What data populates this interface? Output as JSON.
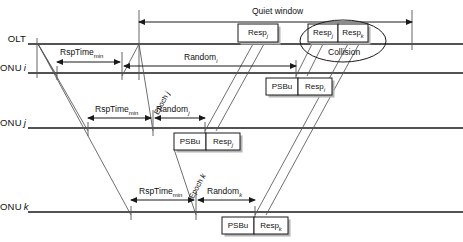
{
  "figure": {
    "line_color": "#1a1a1a",
    "thin_color": "#555555",
    "box_fill": "#ffffff",
    "shadow_color": "#b4b4b4"
  },
  "axes": [
    {
      "id": "olt",
      "label_main": "OLT",
      "label_italic": "",
      "y": 44
    },
    {
      "id": "onu_i",
      "label_main": "ONU",
      "label_italic": "i",
      "y": 73
    },
    {
      "id": "onu_j",
      "label_main": "ONU",
      "label_italic": "j",
      "y": 128
    },
    {
      "id": "onu_k",
      "label_main": "ONU",
      "label_italic": "k",
      "y": 212
    }
  ],
  "quiet_window": {
    "label": "Quiet window",
    "label_x": 252,
    "label_y": 6,
    "arrow_y": 22,
    "x_start": 139,
    "x_end": 412
  },
  "measures": [
    {
      "id": "rsptime-i",
      "name": "RspTime",
      "subscript": "min",
      "label_x": 60,
      "label_y": 47,
      "arrow_y": 62,
      "x_start": 57,
      "x_end": 120
    },
    {
      "id": "random-i",
      "name": "Random",
      "subscript": "i",
      "italic_sub": true,
      "label_x": 184,
      "label_y": 52,
      "arrow_y": 66,
      "x_start": 124,
      "x_end": 296
    },
    {
      "id": "rsptime-j",
      "name": "RspTime",
      "subscript": "min",
      "label_x": 95,
      "label_y": 104,
      "arrow_y": 118,
      "x_start": 88,
      "x_end": 151
    },
    {
      "id": "random-j",
      "name": "Random",
      "subscript": "j",
      "italic_sub": true,
      "label_x": 156,
      "label_y": 104,
      "arrow_y": 118,
      "x_start": 155,
      "x_end": 205
    },
    {
      "id": "rsptime-k",
      "name": "RspTime",
      "subscript": "min",
      "label_x": 139,
      "label_y": 186,
      "arrow_y": 200,
      "x_start": 131,
      "x_end": 194
    },
    {
      "id": "random-k",
      "name": "Random",
      "subscript": "k",
      "italic_sub": true,
      "label_x": 207,
      "label_y": 186,
      "arrow_y": 200,
      "x_start": 198,
      "x_end": 255
    }
  ],
  "epochs": [
    {
      "id": "epoch-j",
      "name": "Epoch",
      "subscript": "j",
      "x": 152,
      "y": 112,
      "angle": -62
    },
    {
      "id": "epoch-k",
      "name": "Epoch",
      "subscript": "k",
      "x": 187,
      "y": 196,
      "angle": -62
    }
  ],
  "boxes": [
    {
      "id": "olt-resp-j",
      "parts": [
        {
          "text": "Resp",
          "sub": "j",
          "italic_sub": true,
          "w": 40
        }
      ],
      "x": 238,
      "y": 24,
      "h": 18
    },
    {
      "id": "olt-collision-resp-j",
      "parts": [
        {
          "text": "Resp",
          "sub": "j",
          "italic_sub": true,
          "w": 30
        },
        {
          "text": "Resp",
          "sub": "k",
          "italic_sub": true,
          "w": 30
        }
      ],
      "x": 308,
      "y": 24,
      "h": 18
    },
    {
      "id": "onu-i-burst",
      "parts": [
        {
          "text": "PSBu",
          "sub": "",
          "w": 32
        },
        {
          "text": "Resp",
          "sub": "i",
          "italic_sub": true,
          "w": 34
        }
      ],
      "x": 266,
      "y": 78,
      "h": 17
    },
    {
      "id": "onu-j-burst",
      "parts": [
        {
          "text": "PSBu",
          "sub": "",
          "w": 32
        },
        {
          "text": "Resp",
          "sub": "j",
          "italic_sub": true,
          "w": 34
        }
      ],
      "x": 174,
      "y": 133,
      "h": 17
    },
    {
      "id": "onu-k-burst",
      "parts": [
        {
          "text": "PSBu",
          "sub": "",
          "w": 32
        },
        {
          "text": "Resp",
          "sub": "k",
          "italic_sub": true,
          "w": 34
        }
      ],
      "x": 222,
      "y": 217,
      "h": 17
    }
  ],
  "collision": {
    "label": "Collision",
    "label_x": 328,
    "label_y": 47,
    "ellipse_cx": 343,
    "ellipse_cy": 41,
    "ellipse_rx": 43,
    "ellipse_ry": 21
  },
  "verticals": [
    {
      "id": "tick-olt-start",
      "x": 37,
      "y1": 38,
      "y2": 78
    },
    {
      "id": "tick-qw-start",
      "x": 139,
      "y1": 10,
      "y2": 80
    },
    {
      "id": "tick-qw-end",
      "x": 412,
      "y1": 10,
      "y2": 50
    },
    {
      "id": "tick-i-rsp-a",
      "x": 57,
      "y1": 66,
      "y2": 80
    },
    {
      "id": "tick-i-rsp-b",
      "x": 122,
      "y1": 52,
      "y2": 80
    },
    {
      "id": "tick-j-rsp-a",
      "x": 88,
      "y1": 122,
      "y2": 136
    },
    {
      "id": "tick-j-rsp-b",
      "x": 153,
      "y1": 110,
      "y2": 136
    },
    {
      "id": "tick-k-rsp-a",
      "x": 131,
      "y1": 206,
      "y2": 220
    },
    {
      "id": "tick-k-rsp-b",
      "x": 196,
      "y1": 192,
      "y2": 220
    },
    {
      "id": "tick-j-send",
      "x": 205,
      "y1": 122,
      "y2": 152
    },
    {
      "id": "tick-k-send",
      "x": 255,
      "y1": 206,
      "y2": 236
    },
    {
      "id": "tick-i-send",
      "x": 296,
      "y1": 60,
      "y2": 97
    }
  ],
  "diagonals": [
    {
      "id": "prop-olt-to-i",
      "x1": 38,
      "y1": 44,
      "x2": 57,
      "y2": 76
    },
    {
      "id": "prop-olt-to-j",
      "x1": 38,
      "y1": 44,
      "x2": 88,
      "y2": 131
    },
    {
      "id": "prop-olt-to-k",
      "x1": 38,
      "y1": 44,
      "x2": 131,
      "y2": 215
    },
    {
      "id": "prop-qw-to-i",
      "x1": 139,
      "y1": 44,
      "x2": 122,
      "y2": 76
    },
    {
      "id": "epoch-j-line",
      "x1": 139,
      "y1": 44,
      "x2": 153,
      "y2": 131
    },
    {
      "id": "epoch-k-line",
      "x1": 174,
      "y1": 149,
      "x2": 196,
      "y2": 215
    },
    {
      "id": "resp-j-up",
      "x1": 205,
      "y1": 131,
      "x2": 253,
      "y2": 44
    },
    {
      "id": "resp-j-up2",
      "x1": 216,
      "y1": 131,
      "x2": 264,
      "y2": 44
    },
    {
      "id": "resp-i-up",
      "x1": 296,
      "y1": 76,
      "x2": 312,
      "y2": 44
    },
    {
      "id": "resp-i-up2",
      "x1": 307,
      "y1": 76,
      "x2": 323,
      "y2": 44
    },
    {
      "id": "resp-k-up",
      "x1": 255,
      "y1": 215,
      "x2": 348,
      "y2": 44
    },
    {
      "id": "resp-k-up2",
      "x1": 266,
      "y1": 215,
      "x2": 359,
      "y2": 44
    }
  ]
}
